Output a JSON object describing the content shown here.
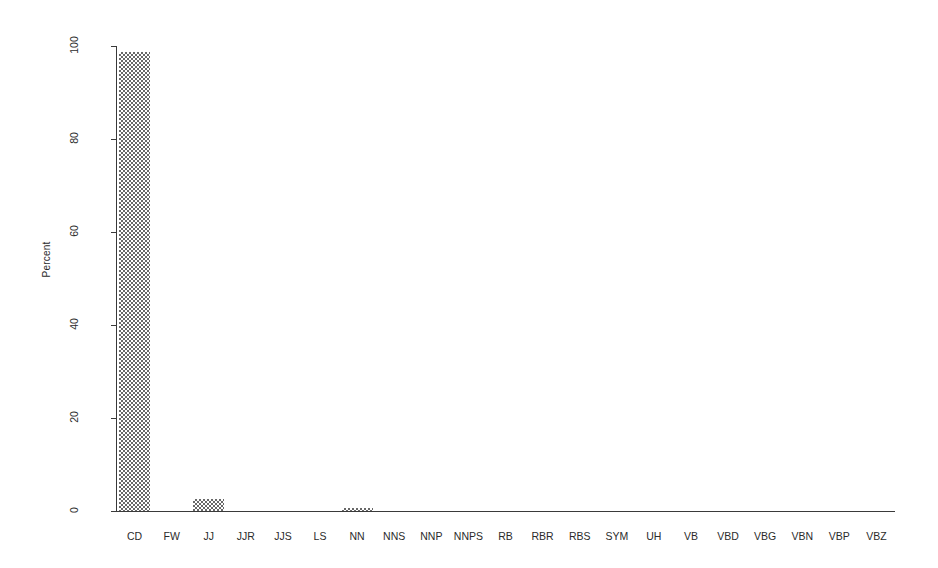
{
  "chart_data": {
    "type": "bar",
    "title": "",
    "xlabel": "",
    "ylabel": "Percent",
    "ylim": [
      0,
      100
    ],
    "yticks": [
      0,
      20,
      40,
      60,
      80,
      100
    ],
    "ytick_labels": [
      "0",
      "20",
      "40",
      "60",
      "80",
      "100"
    ],
    "grid": false,
    "legend": "none",
    "categories": [
      "CD",
      "FW",
      "JJ",
      "JJR",
      "JJS",
      "LS",
      "NN",
      "NNS",
      "NNP",
      "NNPS",
      "RB",
      "RBR",
      "RBS",
      "SYM",
      "UH",
      "VB",
      "VBD",
      "VBG",
      "VBN",
      "VBP",
      "VBZ"
    ],
    "values": [
      98.7,
      0,
      2.6,
      0,
      0,
      0,
      0.6,
      0,
      0,
      0,
      0,
      0,
      0,
      0,
      0,
      0,
      0,
      0,
      0,
      0,
      0
    ],
    "bar_fill": "checkered-gray-dither",
    "bar_color": "#686868",
    "axis_color": "#3a3a3a",
    "background": "#ffffff"
  }
}
